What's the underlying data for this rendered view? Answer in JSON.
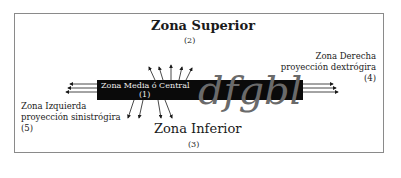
{
  "diagram": {
    "top_zone": {
      "title": "Zona Superior",
      "number": "(2)"
    },
    "bottom_zone": {
      "title": "Zona Inferior",
      "number": "(3)"
    },
    "middle_zone": {
      "title": "Zona Media ó Central",
      "number": "(1)"
    },
    "right_zone": {
      "line1": "Zona Derecha",
      "line2": "proyección dextrógira",
      "number": "(4)"
    },
    "left_zone": {
      "line1": "Zona Izquierda",
      "line2": "proyección sinistrógira",
      "number": "(5)"
    },
    "handwriting_sample": "dfgbl",
    "colors": {
      "bar": "#0a0a0a",
      "frame": "#8a8a8a",
      "script": "#6a6a6a",
      "text": "#1a1a1a"
    }
  }
}
